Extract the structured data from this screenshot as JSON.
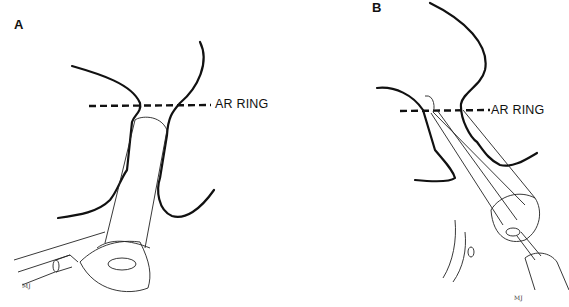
{
  "figure": {
    "panels": [
      {
        "id": "A",
        "label": "A",
        "landmark_label": "AR RING",
        "signature": "MJ"
      },
      {
        "id": "B",
        "label": "B",
        "landmark_label": "AR RING",
        "signature": "MJ"
      }
    ]
  }
}
